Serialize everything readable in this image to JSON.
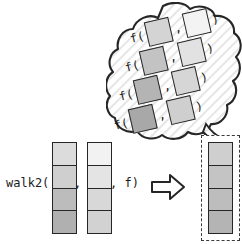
{
  "figure": {
    "background": "#ffffff",
    "stroke": "#262626"
  },
  "expression": {
    "head": "walk2(",
    "separator": ",",
    "tail": ", f)"
  },
  "arrow": {
    "icon": "right-arrow-icon",
    "direction": "right"
  },
  "strips": {
    "input_a": {
      "label": "first input collection",
      "cells": [
        {
          "index": 0,
          "color": "#dcdcdc"
        },
        {
          "index": 1,
          "color": "#cfcfcf"
        },
        {
          "index": 2,
          "color": "#bcbcbc"
        },
        {
          "index": 3,
          "color": "#b0b0b0"
        }
      ]
    },
    "input_b": {
      "label": "second input collection",
      "cells": [
        {
          "index": 0,
          "color": "#f2f2f2"
        },
        {
          "index": 1,
          "color": "#e4e4e4"
        },
        {
          "index": 2,
          "color": "#d8d8d8"
        },
        {
          "index": 3,
          "color": "#d2d2d2"
        }
      ]
    },
    "result": {
      "label": "result collection",
      "cells": [
        {
          "index": 0,
          "color": "#cfcfcf"
        },
        {
          "index": 1,
          "color": "#c4c4c4"
        },
        {
          "index": 2,
          "color": "#bdbdbd"
        },
        {
          "index": 3,
          "color": "#b4b4b4"
        }
      ]
    }
  },
  "cloud": {
    "label": "thought cloud of pairwise applications",
    "fill": "#fbfbfb",
    "hatch_color": "#e3e3e3",
    "rows": [
      {
        "call": "f(",
        "sep": ",",
        "close": ")",
        "left_color": "#d4d4d4",
        "right_color": "#f3f3f3"
      },
      {
        "call": "f(",
        "sep": ",",
        "close": ")",
        "left_color": "#c3c3c3",
        "right_color": "#e2e2e2"
      },
      {
        "call": "f(",
        "sep": ",",
        "close": ")",
        "left_color": "#b4b4b4",
        "right_color": "#d6d6d6"
      },
      {
        "call": "f(",
        "sep": ",",
        "close": ")",
        "left_color": "#a8a8a8",
        "right_color": "#cfcfcf"
      }
    ]
  }
}
